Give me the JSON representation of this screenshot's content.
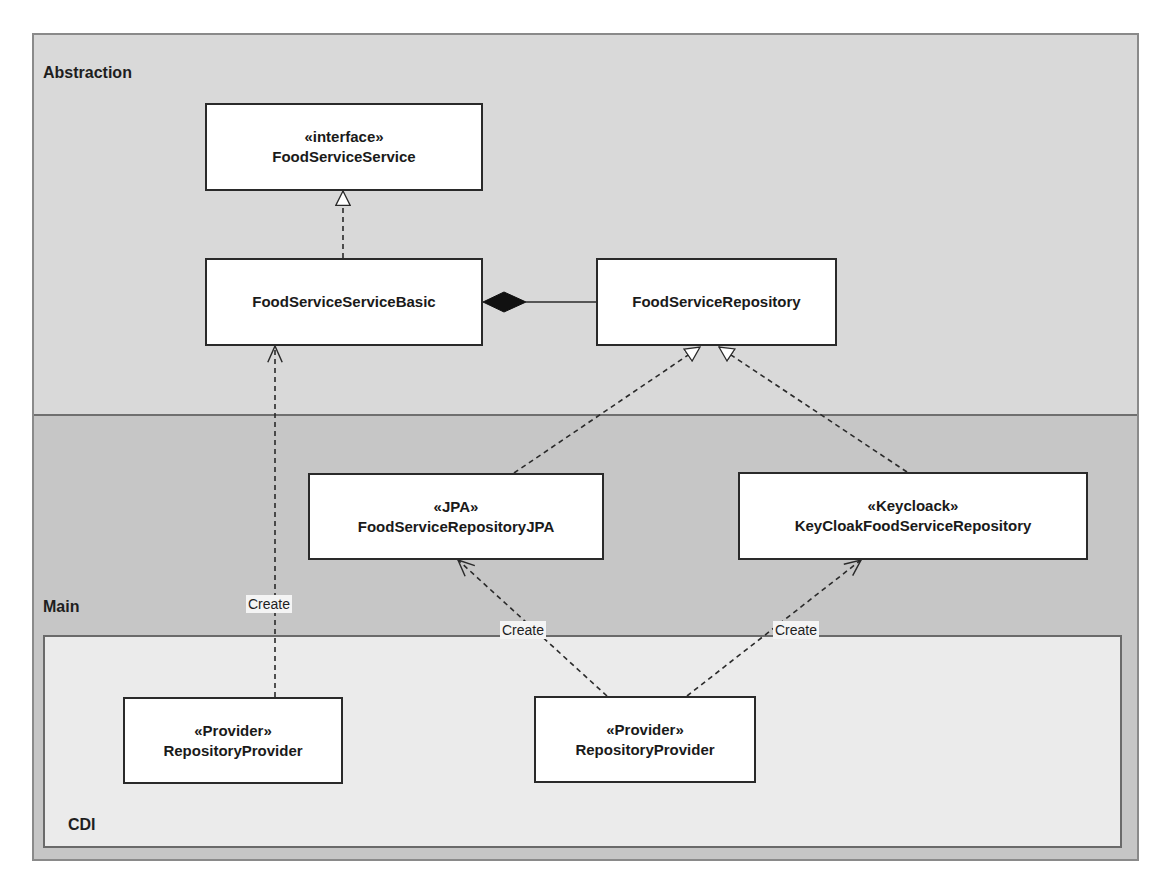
{
  "regions": {
    "abstraction": {
      "label": "Abstraction"
    },
    "main": {
      "label": "Main"
    },
    "cdi": {
      "label": "CDI"
    }
  },
  "classes": {
    "food_service_service": {
      "stereotype": "«interface»",
      "name": "FoodServiceService"
    },
    "food_service_service_basic": {
      "name": "FoodServiceServiceBasic"
    },
    "food_service_repository": {
      "name": "FoodServiceRepository"
    },
    "food_service_repository_jpa": {
      "stereotype": "«JPA»",
      "name": "FoodServiceRepositoryJPA"
    },
    "keycloak_food_service_repository": {
      "stereotype": "«Keycloack»",
      "name": "KeyCloakFoodServiceRepository"
    },
    "repository_provider_left": {
      "stereotype": "«Provider»",
      "name": "RepositoryProvider"
    },
    "repository_provider_right": {
      "stereotype": "«Provider»",
      "name": "RepositoryProvider"
    }
  },
  "relationships": [
    {
      "from": "FoodServiceServiceBasic",
      "to": "FoodServiceService",
      "type": "realization"
    },
    {
      "from": "FoodServiceRepository",
      "to": "FoodServiceServiceBasic",
      "type": "composition"
    },
    {
      "from": "FoodServiceRepositoryJPA",
      "to": "FoodServiceRepository",
      "type": "realization"
    },
    {
      "from": "KeyCloakFoodServiceRepository",
      "to": "FoodServiceRepository",
      "type": "realization"
    },
    {
      "from": "RepositoryProvider (left)",
      "to": "FoodServiceServiceBasic",
      "type": "dependency",
      "label": "Create"
    },
    {
      "from": "RepositoryProvider (right)",
      "to": "FoodServiceRepositoryJPA",
      "type": "dependency",
      "label": "Create"
    },
    {
      "from": "RepositoryProvider (right)",
      "to": "KeyCloakFoodServiceRepository",
      "type": "dependency",
      "label": "Create"
    }
  ],
  "edge_labels": {
    "create_left": "Create",
    "create_jpa": "Create",
    "create_keycloak": "Create"
  },
  "colors": {
    "abstraction_bg": "#d9d9d9",
    "main_bg": "#c6c6c6",
    "cdi_bg": "#ebebeb",
    "box_fill": "#ffffff",
    "line": "#2a2a2a"
  }
}
